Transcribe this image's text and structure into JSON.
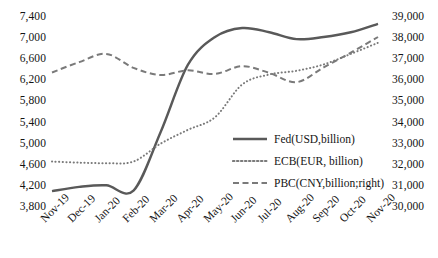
{
  "chart_data": {
    "type": "line",
    "title": "",
    "subtitle": "",
    "xlabel": "",
    "ylabel": "",
    "y2label": "",
    "grid": false,
    "legend_position": "inside-right",
    "categories": [
      "Nov-19",
      "Dec-19",
      "Jan-20",
      "Feb-20",
      "Mar-20",
      "Apr-20",
      "May-20",
      "Jun-20",
      "Jul-20",
      "Aug-20",
      "Sep-20",
      "Oct-20",
      "Nov-20"
    ],
    "ylim": [
      3800,
      7400
    ],
    "yticks": [
      "3,800",
      "4,200",
      "4,600",
      "5,000",
      "5,400",
      "5,800",
      "6,200",
      "6,600",
      "7,000",
      "7,400"
    ],
    "y2lim": [
      30000,
      39000
    ],
    "y2ticks": [
      "30,000",
      "31,000",
      "32,000",
      "33,000",
      "34,000",
      "35,000",
      "36,000",
      "37,000",
      "38,000",
      "39,000"
    ],
    "series": [
      {
        "name": "Fed(USD,billion)",
        "axis": "left",
        "style": "solid",
        "color": "#595959",
        "values": [
          4120,
          4200,
          4230,
          4130,
          5240,
          6510,
          7040,
          7210,
          7130,
          7000,
          7040,
          7130,
          7290
        ]
      },
      {
        "name": "ECB(EUR, billion)",
        "axis": "left",
        "style": "dotted",
        "color": "#7a7a7a",
        "values": [
          4680,
          4660,
          4650,
          4680,
          5020,
          5280,
          5520,
          6140,
          6330,
          6400,
          6520,
          6720,
          6930
        ]
      },
      {
        "name": "PBC(CNY,billion;right)",
        "axis": "right",
        "style": "dashed",
        "color": "#7a7a7a",
        "values": [
          36420,
          36910,
          37300,
          36640,
          36300,
          36520,
          36350,
          36720,
          36400,
          35960,
          36660,
          37360,
          38100
        ]
      }
    ]
  },
  "legend": {
    "items": [
      {
        "label": "Fed(USD,billion)",
        "style": "solid"
      },
      {
        "label": "ECB(EUR, billion)",
        "style": "dotted"
      },
      {
        "label": "PBC(CNY,billion;right)",
        "style": "dashed"
      }
    ]
  },
  "colors": {
    "series_solid": "#595959",
    "series_dotted": "#7a7a7a",
    "series_dashed": "#7a7a7a",
    "text": "#141414",
    "background": "#ffffff"
  }
}
